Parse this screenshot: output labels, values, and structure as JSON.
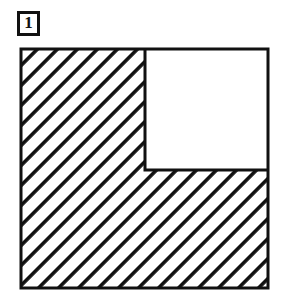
{
  "figure": {
    "label": {
      "text": "1",
      "style": "boxed-number"
    },
    "title": "",
    "caption": "",
    "diagram": {
      "kind": "geometry-shape",
      "description": "Large square with a smaller square removed from the upper-right corner, forming an L-shaped (gnomon) region filled with 45-degree diagonal hatching.",
      "outer_square": {
        "name": "outer-square",
        "x": 3,
        "y": 3,
        "width": 247,
        "height": 239,
        "stroke": "#111111",
        "stroke_width": 3,
        "fill": "none"
      },
      "notch_square": {
        "name": "notch-square",
        "x": 127,
        "y": 3,
        "width": 123,
        "height": 121,
        "stroke": "#111111",
        "stroke_width": 3,
        "fill": "#ffffff",
        "position": "top-right"
      },
      "hatched_region": {
        "name": "hatched-l-region",
        "fill_pattern": "diagonal-hatch-45",
        "hatch_angle_degrees": 45,
        "hatch_spacing_px": 20,
        "hatch_line_width_px": 5,
        "hatch_color": "#111111",
        "background_color": "#ffffff"
      },
      "colors": {
        "ink": "#111111",
        "paper": "#ffffff"
      },
      "labels": [],
      "dimension_marks": []
    }
  }
}
